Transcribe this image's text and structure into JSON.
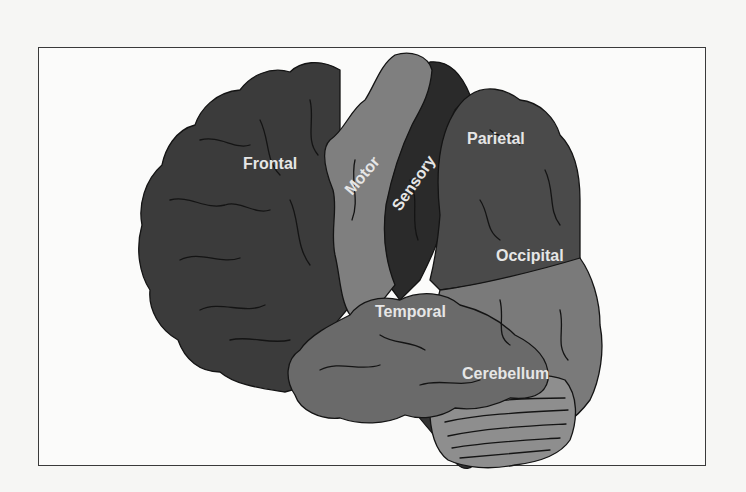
{
  "diagram": {
    "title": "",
    "type": "labeled-anatomy-diagram",
    "regions": [
      {
        "id": "frontal",
        "label": "Frontal",
        "color": "#3b3b3b"
      },
      {
        "id": "motor",
        "label": "Motor",
        "color": "#7f7f7f"
      },
      {
        "id": "sensory",
        "label": "Sensory",
        "color": "#2a2a2a"
      },
      {
        "id": "parietal",
        "label": "Parietal",
        "color": "#4a4a4a"
      },
      {
        "id": "occipital",
        "label": "Occipital",
        "color": "#7a7a7a"
      },
      {
        "id": "temporal",
        "label": "Temporal",
        "color": "#6a6a6a"
      },
      {
        "id": "cerebellum",
        "label": "Cerebellum",
        "color": "#8e8e8e"
      },
      {
        "id": "brainstem",
        "label": "",
        "color": "#333333"
      }
    ],
    "colors": {
      "background": "#f6f6f4",
      "frame_border": "#3a3a3a",
      "label_text": "#e6e6e6",
      "outline": "#141414"
    }
  }
}
